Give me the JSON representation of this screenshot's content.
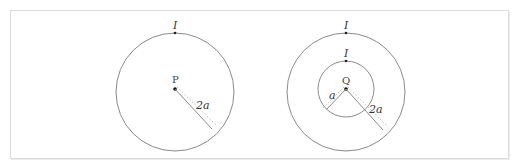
{
  "figure": {
    "left": {
      "current_label": "I",
      "center_label": "P",
      "radius_label": "2a"
    },
    "right": {
      "outer_current_label": "I",
      "inner_current_label": "I",
      "center_label": "Q",
      "inner_radius_label": "a",
      "outer_radius_label": "2a"
    },
    "colors": {
      "stroke": "#8a8a8a",
      "frame": "#dcdcdc"
    }
  }
}
